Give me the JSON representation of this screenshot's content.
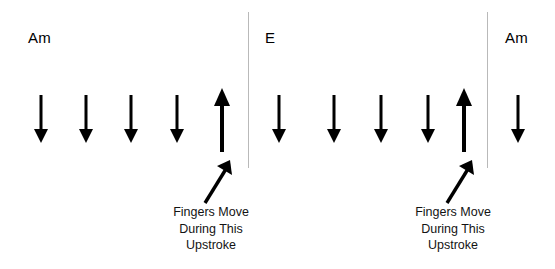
{
  "canvas": {
    "width": 555,
    "height": 269,
    "background": "#ffffff",
    "ink": "#000000",
    "divider_color": "#b9b9b9",
    "text_color": "#131313"
  },
  "dividers": [
    {
      "name": "measure-divider-1",
      "x": 248,
      "y": 12,
      "height": 156
    },
    {
      "name": "measure-divider-2",
      "x": 487,
      "y": 12,
      "height": 156
    }
  ],
  "measures": [
    {
      "chord": "Am",
      "chord_label_x": 28,
      "chord_label_y": 30,
      "strums": [
        {
          "direction": "down",
          "x": 41
        },
        {
          "direction": "down",
          "x": 86
        },
        {
          "direction": "down",
          "x": 131
        },
        {
          "direction": "down",
          "x": 177
        },
        {
          "direction": "up",
          "x": 222
        }
      ]
    },
    {
      "chord": "E",
      "chord_label_x": 265,
      "chord_label_y": 30,
      "strums": [
        {
          "direction": "down",
          "x": 279
        },
        {
          "direction": "down",
          "x": 334
        },
        {
          "direction": "down",
          "x": 381
        },
        {
          "direction": "down",
          "x": 428
        },
        {
          "direction": "up",
          "x": 464
        }
      ]
    },
    {
      "chord": "Am",
      "chord_label_x": 505,
      "chord_label_y": 30,
      "strums": [
        {
          "direction": "down",
          "x": 518
        }
      ]
    }
  ],
  "annotations": [
    {
      "name": "upstroke-annotation-left",
      "pointer": {
        "x": 199,
        "y": 160,
        "width": 36,
        "height": 46
      },
      "caption_center_x": 211,
      "caption_y": 204,
      "lines": [
        "Fingers Move",
        "During This",
        "Upstroke"
      ]
    },
    {
      "name": "upstroke-annotation-right",
      "pointer": {
        "x": 441,
        "y": 160,
        "width": 36,
        "height": 46
      },
      "caption_center_x": 453,
      "caption_y": 204,
      "lines": [
        "Fingers Move",
        "During This",
        "Upstroke"
      ]
    }
  ],
  "geometry": {
    "down_arrow": {
      "top": 95,
      "height": 48,
      "shaft_width": 3,
      "head_width": 14,
      "head_height": 14
    },
    "up_arrow": {
      "top": 88,
      "height": 64,
      "shaft_width": 4,
      "head_width": 16,
      "head_height": 18
    }
  }
}
